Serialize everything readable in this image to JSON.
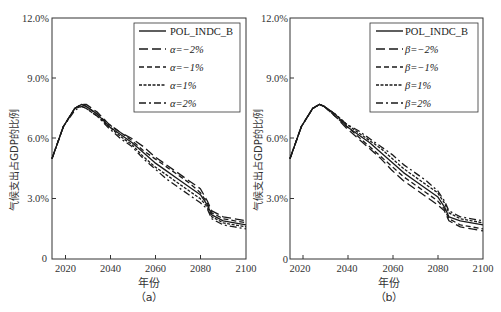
{
  "chart_data": [
    {
      "type": "line",
      "panel": "a",
      "caption": "（a）",
      "title": "",
      "xlabel": "年份",
      "ylabel": "气候支出占GDP的比例",
      "xlim": [
        2015,
        2100
      ],
      "ylim": [
        0,
        12
      ],
      "xticks": [
        "2020",
        "2040",
        "2060",
        "2080",
        "2100"
      ],
      "yticks": [
        "0",
        "3.0%",
        "6.0%",
        "9.0%",
        "12.0%"
      ],
      "grid": false,
      "legend_position": "upper right",
      "x": [
        2015,
        2020,
        2025,
        2028,
        2030,
        2035,
        2040,
        2045,
        2050,
        2055,
        2060,
        2065,
        2070,
        2075,
        2080,
        2083,
        2085,
        2090,
        2095,
        2100
      ],
      "series": [
        {
          "name": "POL_INDC_B",
          "style": "solid",
          "values": [
            5.0,
            6.6,
            7.5,
            7.7,
            7.6,
            7.2,
            6.6,
            6.2,
            5.8,
            5.3,
            4.8,
            4.4,
            4.0,
            3.6,
            3.2,
            2.7,
            2.2,
            1.9,
            1.8,
            1.7
          ]
        },
        {
          "name": "α=−2%",
          "style": "longdash",
          "values": [
            5.0,
            6.6,
            7.5,
            7.7,
            7.7,
            7.3,
            6.7,
            6.3,
            6.0,
            5.6,
            5.1,
            4.7,
            4.3,
            3.9,
            3.5,
            2.9,
            2.4,
            2.1,
            2.0,
            1.9
          ]
        },
        {
          "name": "α=−1%",
          "style": "dash",
          "values": [
            5.0,
            6.6,
            7.5,
            7.7,
            7.6,
            7.2,
            6.7,
            6.3,
            5.9,
            5.4,
            5.0,
            4.6,
            4.2,
            3.8,
            3.3,
            2.8,
            2.3,
            2.0,
            1.9,
            1.8
          ]
        },
        {
          "name": "α=1%",
          "style": "shortdash",
          "values": [
            5.0,
            6.6,
            7.5,
            7.6,
            7.5,
            7.1,
            6.6,
            6.1,
            5.7,
            5.1,
            4.6,
            4.2,
            3.8,
            3.4,
            3.0,
            2.6,
            2.1,
            1.8,
            1.7,
            1.6
          ]
        },
        {
          "name": "α=2%",
          "style": "dashdot",
          "values": [
            5.0,
            6.6,
            7.4,
            7.6,
            7.5,
            7.1,
            6.5,
            6.0,
            5.6,
            5.0,
            4.5,
            4.0,
            3.6,
            3.2,
            2.8,
            2.5,
            2.0,
            1.7,
            1.6,
            1.5
          ]
        }
      ]
    },
    {
      "type": "line",
      "panel": "b",
      "caption": "（b）",
      "title": "",
      "xlabel": "年份",
      "ylabel": "气候支出占GDP的比例",
      "xlim": [
        2015,
        2100
      ],
      "ylim": [
        0,
        12
      ],
      "xticks": [
        "2020",
        "2040",
        "2060",
        "2080",
        "2100"
      ],
      "yticks": [
        "0",
        "3.0%",
        "6.0%",
        "9.0%",
        "12.0%"
      ],
      "grid": false,
      "legend_position": "upper right",
      "x": [
        2015,
        2020,
        2025,
        2028,
        2030,
        2035,
        2040,
        2045,
        2050,
        2055,
        2060,
        2065,
        2070,
        2075,
        2080,
        2083,
        2085,
        2090,
        2095,
        2100
      ],
      "series": [
        {
          "name": "POL_INDC_B",
          "style": "solid",
          "values": [
            5.0,
            6.6,
            7.5,
            7.7,
            7.6,
            7.2,
            6.6,
            6.2,
            5.8,
            5.3,
            4.8,
            4.3,
            3.9,
            3.5,
            3.1,
            2.6,
            2.1,
            1.9,
            1.8,
            1.7
          ]
        },
        {
          "name": "β=−2%",
          "style": "longdash",
          "values": [
            5.0,
            6.6,
            7.5,
            7.7,
            7.6,
            7.1,
            6.5,
            6.0,
            5.5,
            5.0,
            4.4,
            3.9,
            3.5,
            3.1,
            2.7,
            2.4,
            1.9,
            1.6,
            1.5,
            1.4
          ]
        },
        {
          "name": "β=−1%",
          "style": "dash",
          "values": [
            5.0,
            6.6,
            7.5,
            7.7,
            7.6,
            7.1,
            6.6,
            6.1,
            5.6,
            5.1,
            4.6,
            4.1,
            3.7,
            3.3,
            2.9,
            2.5,
            2.0,
            1.7,
            1.6,
            1.5
          ]
        },
        {
          "name": "β=1%",
          "style": "shortdash",
          "values": [
            5.0,
            6.6,
            7.5,
            7.7,
            7.6,
            7.2,
            6.7,
            6.3,
            5.9,
            5.5,
            5.0,
            4.5,
            4.1,
            3.7,
            3.3,
            2.8,
            2.3,
            2.0,
            1.9,
            1.8
          ]
        },
        {
          "name": "β=2%",
          "style": "dashdot",
          "values": [
            5.0,
            6.6,
            7.5,
            7.7,
            7.6,
            7.2,
            6.7,
            6.4,
            6.0,
            5.6,
            5.2,
            4.7,
            4.3,
            3.9,
            3.4,
            2.9,
            2.4,
            2.1,
            2.0,
            1.9
          ]
        }
      ]
    }
  ],
  "panels": [
    {
      "yticks": [
        "0",
        "3.0%",
        "6.0%",
        "9.0%",
        "12.0%"
      ],
      "xticks": [
        "2020",
        "2040",
        "2060",
        "2080",
        "2100"
      ],
      "xlabel": "年份",
      "ylabel": "气候支出占GDP的比例",
      "caption": "（a）",
      "legend": [
        "POL_INDC_B",
        "α=−2%",
        "α=−1%",
        "α=1%",
        "α=2%"
      ]
    },
    {
      "yticks": [
        "0",
        "3.0%",
        "6.0%",
        "9.0%",
        "12.0%"
      ],
      "xticks": [
        "2020",
        "2040",
        "2060",
        "2080",
        "2100"
      ],
      "xlabel": "年份",
      "ylabel": "气候支出占GDP的比例",
      "caption": "（b）",
      "legend": [
        "POL_INDC_B",
        "β=−2%",
        "β=−1%",
        "β=1%",
        "β=2%"
      ]
    }
  ],
  "colors": {
    "line": "#1a1a1a",
    "axis": "#333333",
    "background": "#ffffff"
  }
}
